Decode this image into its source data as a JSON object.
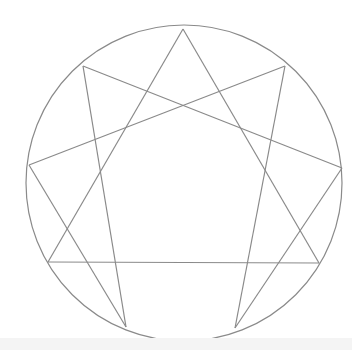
{
  "diagram": {
    "stroke_color": "#8a8a8a",
    "circle": {
      "cx": 184,
      "cy": 183,
      "r": 158
    },
    "points": {
      "9": [
        183,
        29
      ],
      "1": [
        285,
        66
      ],
      "2": [
        342,
        168
      ],
      "3": [
        319,
        263
      ],
      "4": [
        235,
        328
      ],
      "5": [
        126,
        327
      ],
      "6": [
        48,
        262
      ],
      "7": [
        29,
        165
      ],
      "8": [
        83,
        66
      ]
    },
    "lines": [
      [
        "9",
        "3"
      ],
      [
        "3",
        "6"
      ],
      [
        "6",
        "9"
      ],
      [
        "1",
        "4"
      ],
      [
        "4",
        "2"
      ],
      [
        "2",
        "8"
      ],
      [
        "8",
        "5"
      ],
      [
        "5",
        "7"
      ],
      [
        "7",
        "1"
      ]
    ]
  }
}
